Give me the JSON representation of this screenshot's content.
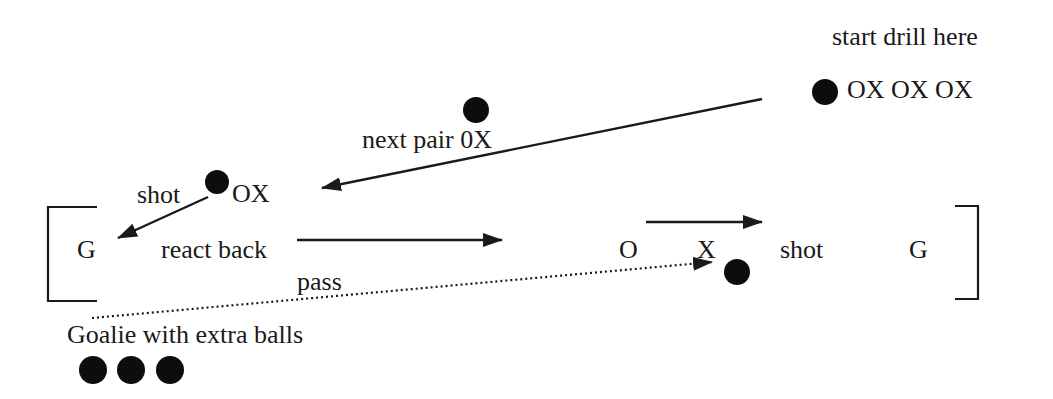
{
  "diagram": {
    "type": "drill-diagram",
    "colors": {
      "ink": "#1a1a1a",
      "ball": "#0d0d0d",
      "background": "#ffffff"
    },
    "labels": {
      "start": "start drill here",
      "queue": "OX OX OX",
      "next_pair": "next pair 0X",
      "shot_left": "shot",
      "pair_left": "OX",
      "goalie_left": "G",
      "react_back": "react back",
      "player_o": "O",
      "player_x": "X",
      "shot_right": "shot",
      "goalie_right": "G",
      "pass": "pass",
      "goalie_extra": "Goalie with extra balls"
    },
    "balls": [
      {
        "name": "start-ball",
        "cx": 825,
        "cy": 92
      },
      {
        "name": "next-pair-ball",
        "cx": 476,
        "cy": 110
      },
      {
        "name": "shot-ball",
        "cx": 217,
        "cy": 182
      },
      {
        "name": "receive-ball",
        "cx": 737,
        "cy": 272
      },
      {
        "name": "extra-ball-1",
        "cx": 93,
        "cy": 370
      },
      {
        "name": "extra-ball-2",
        "cx": 131,
        "cy": 370
      },
      {
        "name": "extra-ball-3",
        "cx": 170,
        "cy": 370
      }
    ],
    "arrows": [
      {
        "name": "next-pair-arrow",
        "from": [
          762,
          99
        ],
        "to": [
          322,
          188
        ],
        "style": "solid"
      },
      {
        "name": "shot-arrow",
        "from": [
          208,
          197
        ],
        "to": [
          118,
          238
        ],
        "style": "solid"
      },
      {
        "name": "react-back-arrow",
        "from": [
          297,
          240
        ],
        "to": [
          502,
          240
        ],
        "style": "solid"
      },
      {
        "name": "attack-arrow",
        "from": [
          646,
          222
        ],
        "to": [
          762,
          222
        ],
        "style": "solid"
      },
      {
        "name": "pass-arrow",
        "from": [
          92,
          318
        ],
        "to": [
          712,
          262
        ],
        "style": "dotted"
      }
    ]
  }
}
